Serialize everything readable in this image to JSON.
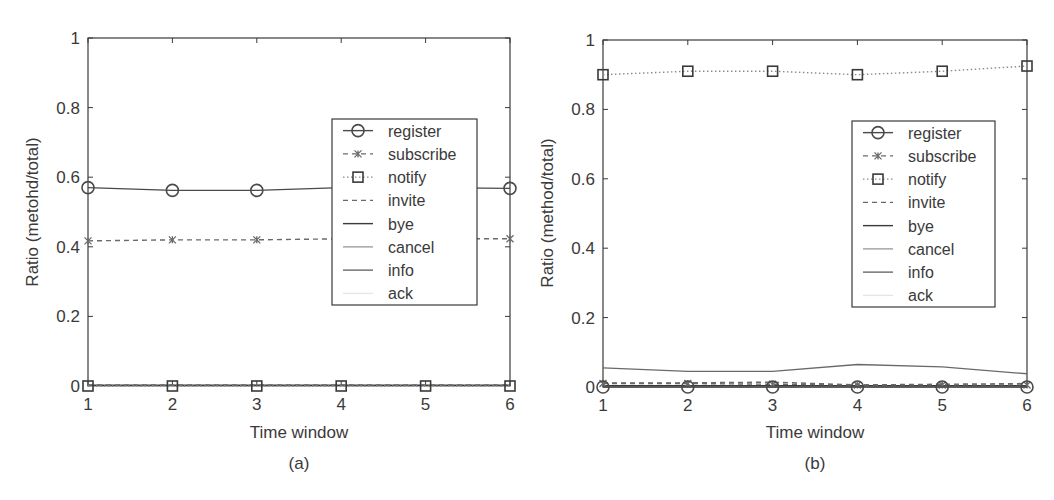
{
  "figure": {
    "panels": [
      "(a)",
      "(b)"
    ]
  },
  "chart_data": [
    {
      "type": "line",
      "panel_label": "(a)",
      "title": "",
      "xlabel": "Time window",
      "ylabel": "Ratio (metohd/total)",
      "x": [
        1,
        2,
        3,
        4,
        5,
        6
      ],
      "xticks": [
        "1",
        "2",
        "3",
        "4",
        "5",
        "6"
      ],
      "yticks": [
        "0",
        "0.2",
        "0.4",
        "0.6",
        "0.8",
        "1"
      ],
      "xlim": [
        1,
        6
      ],
      "ylim": [
        0,
        1
      ],
      "grid": false,
      "legend_position": "center-right",
      "series": [
        {
          "name": "register",
          "style": "solid",
          "marker": "circle",
          "color": "#4a4a4a",
          "values": [
            0.57,
            0.562,
            0.562,
            0.57,
            0.57,
            0.568
          ]
        },
        {
          "name": "subscribe",
          "style": "dashed",
          "marker": "x",
          "color": "#6a6a6a",
          "values": [
            0.417,
            0.42,
            0.42,
            0.423,
            0.423,
            0.423
          ]
        },
        {
          "name": "notify",
          "style": "dotted",
          "marker": "square",
          "color": "#8a8a8a",
          "values": [
            0.0,
            0.0,
            0.0,
            0.0,
            0.0,
            0.0
          ]
        },
        {
          "name": "invite",
          "style": "dashed",
          "marker": "none",
          "color": "#6a6a6a",
          "values": [
            0.003,
            0.003,
            0.003,
            0.003,
            0.003,
            0.003
          ]
        },
        {
          "name": "bye",
          "style": "solid",
          "marker": "none",
          "color": "#3a3a3a",
          "values": [
            0.002,
            0.002,
            0.002,
            0.002,
            0.002,
            0.002
          ]
        },
        {
          "name": "cancel",
          "style": "solid",
          "marker": "none",
          "color": "#a0a0a0",
          "values": [
            0.001,
            0.001,
            0.001,
            0.001,
            0.001,
            0.001
          ]
        },
        {
          "name": "info",
          "style": "solid",
          "marker": "none",
          "color": "#6a6a6a",
          "values": [
            0.001,
            0.001,
            0.001,
            0.001,
            0.001,
            0.001
          ]
        },
        {
          "name": "ack",
          "style": "solid",
          "marker": "none",
          "color": "#e6e6e6",
          "values": [
            0.0,
            0.0,
            0.0,
            0.0,
            0.0,
            0.0
          ]
        }
      ]
    },
    {
      "type": "line",
      "panel_label": "(b)",
      "title": "",
      "xlabel": "Time window",
      "ylabel": "Ratio (method/total)",
      "x": [
        1,
        2,
        3,
        4,
        5,
        6
      ],
      "xticks": [
        "1",
        "2",
        "3",
        "4",
        "5",
        "6"
      ],
      "yticks": [
        "0",
        "0.2",
        "0.4",
        "0.6",
        "0.8",
        "1"
      ],
      "xlim": [
        1,
        6
      ],
      "ylim": [
        0,
        1
      ],
      "grid": false,
      "legend_position": "center-right",
      "series": [
        {
          "name": "register",
          "style": "solid",
          "marker": "circle",
          "color": "#4a4a4a",
          "values": [
            0.0,
            0.0,
            0.0,
            0.0,
            0.0,
            0.0
          ]
        },
        {
          "name": "subscribe",
          "style": "dashed",
          "marker": "x",
          "color": "#6a6a6a",
          "values": [
            0.01,
            0.01,
            0.008,
            0.006,
            0.006,
            0.006
          ]
        },
        {
          "name": "notify",
          "style": "dotted",
          "marker": "square",
          "color": "#8a8a8a",
          "values": [
            0.9,
            0.91,
            0.91,
            0.9,
            0.91,
            0.925
          ]
        },
        {
          "name": "invite",
          "style": "dashed",
          "marker": "none",
          "color": "#6a6a6a",
          "values": [
            0.012,
            0.012,
            0.014,
            0.006,
            0.008,
            0.01
          ]
        },
        {
          "name": "bye",
          "style": "solid",
          "marker": "none",
          "color": "#3a3a3a",
          "values": [
            0.004,
            0.004,
            0.004,
            0.004,
            0.004,
            0.004
          ]
        },
        {
          "name": "cancel",
          "style": "solid",
          "marker": "none",
          "color": "#a0a0a0",
          "values": [
            0.002,
            0.002,
            0.002,
            0.002,
            0.002,
            0.002
          ]
        },
        {
          "name": "info",
          "style": "solid",
          "marker": "none",
          "color": "#6a6a6a",
          "values": [
            0.055,
            0.045,
            0.045,
            0.065,
            0.058,
            0.038
          ]
        },
        {
          "name": "ack",
          "style": "solid",
          "marker": "none",
          "color": "#e6e6e6",
          "values": [
            0.001,
            0.001,
            0.001,
            0.001,
            0.001,
            0.001
          ]
        }
      ]
    }
  ]
}
